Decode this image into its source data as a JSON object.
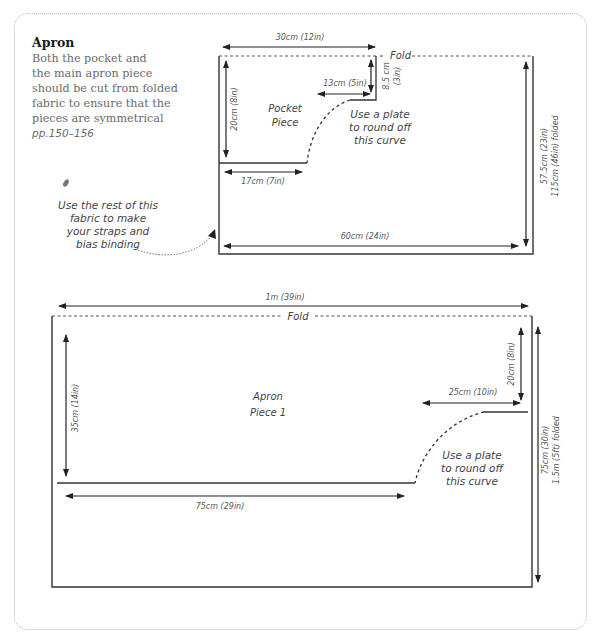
{
  "intro": {
    "title": "Apron",
    "lines": [
      "Both the pocket and",
      "the main apron piece",
      "should be cut from folded",
      "fabric to ensure that the",
      "pieces are symmetrical"
    ],
    "page_ref": "pp.150–156"
  },
  "pocket": {
    "label_line1": "Pocket",
    "label_line2": "Piece",
    "fold_label": "Fold",
    "top_width": "30cm (12in)",
    "notch_width": "13cm (5in)",
    "notch_height_line1": "8.5 cm",
    "notch_height_line2": "(3in)",
    "left_height": "20cm (8in)",
    "bottom_width": "17cm (7in)",
    "fabric_width": "60cm (24in)",
    "fabric_height_line1": "57.5cm (23in)",
    "fabric_height_line2": "115cm (46in) folded",
    "curve_note": [
      "Use a plate",
      "to round off",
      "this curve"
    ]
  },
  "side_note": {
    "lines": [
      "Use the rest of this",
      "fabric to make",
      "your straps and",
      "bias binding"
    ]
  },
  "apron": {
    "label_line1": "Apron",
    "label_line2": "Piece 1",
    "fold_label": "Fold",
    "top_width": "1m (39in)",
    "left_height": "35cm (14in)",
    "bottom_width": "75cm (29in)",
    "notch_width": "25cm (10in)",
    "notch_height": "20cm (8in)",
    "fabric_height_line1": "75cm (30in)",
    "fabric_height_line2": "1.5m (5ft) folded",
    "curve_note": [
      "Use a plate",
      "to round off",
      "this curve"
    ]
  },
  "colors": {
    "line": "#333333",
    "text": "#555555",
    "border": "#b8b8b8"
  }
}
